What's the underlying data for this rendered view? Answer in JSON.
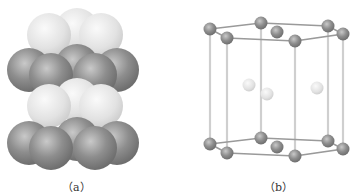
{
  "figure": {
    "panels": [
      {
        "id": "a",
        "label": "（a）",
        "description": "Space-filling model of hexagonal close-packed layers (ABAB stacking)"
      },
      {
        "id": "b",
        "label": "（b）",
        "description": "Ball-and-stick hexagonal close-packed unit cell"
      }
    ],
    "colors": {
      "dark_sphere": "#8f8f8f",
      "light_sphere": "#e6e6e6",
      "rod": "#c8c8c8",
      "background": "#ffffff"
    }
  }
}
